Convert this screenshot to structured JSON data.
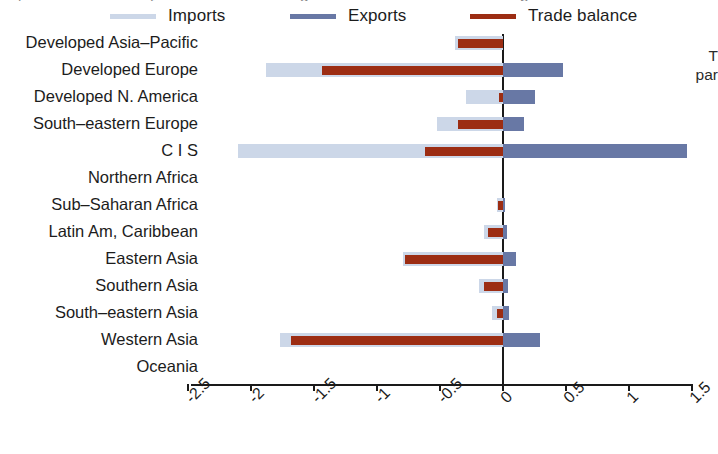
{
  "chart_data": {
    "type": "bar",
    "orientation": "horizontal",
    "title": "",
    "xlabel": "",
    "ylabel": "",
    "xlim": [
      -2.75,
      1.6
    ],
    "grid": false,
    "legend_position": "top",
    "categories": [
      "Developed Asia–Pacific",
      "Developed Europe",
      "Developed N. America",
      "South–eastern Europe",
      "C I S",
      "Northern Africa",
      "Sub–Saharan Africa",
      "Latin Am, Caribbean",
      "Eastern Asia",
      "Southern Asia",
      "South–eastern Asia",
      "Western Asia",
      "Oceania"
    ],
    "series": [
      {
        "name": "Imports",
        "color": "#ccd7e8",
        "values": [
          -0.38,
          -1.88,
          -0.29,
          -0.52,
          -2.1,
          0.0,
          -0.05,
          -0.15,
          -0.79,
          -0.19,
          -0.09,
          -1.77,
          0.0
        ]
      },
      {
        "name": "Exports",
        "color": "#6878a5",
        "values": [
          0.0,
          0.48,
          0.25,
          0.17,
          1.46,
          0.0,
          0.01,
          0.03,
          0.1,
          0.04,
          0.05,
          0.29,
          0.0
        ]
      },
      {
        "name": "Trade balance",
        "color": "#9c2d13",
        "values": [
          -0.36,
          -1.44,
          -0.03,
          -0.36,
          -0.62,
          0.0,
          -0.04,
          -0.12,
          -0.78,
          -0.15,
          -0.05,
          -1.68,
          0.0
        ]
      }
    ],
    "xticks": [
      -2.5,
      -2,
      -1.5,
      -1,
      -0.5,
      0,
      0.5,
      1,
      1.5
    ],
    "xtick_labels": [
      "-2.5",
      "-2",
      "-1.5",
      "-1",
      "-0.5",
      "0",
      "0.5",
      "1",
      "1.5"
    ]
  },
  "legend": {
    "items": [
      {
        "label": "Imports",
        "color": "#ccd7e8"
      },
      {
        "label": "Exports",
        "color": "#6878a5"
      },
      {
        "label": "Trade balance",
        "color": "#9c2d13"
      }
    ]
  },
  "right_caption": {
    "line1": "T",
    "line2": "par"
  },
  "top_sliver": {
    "a": "l",
    "b": "t",
    "c": "g",
    "d": "b"
  },
  "colors": {
    "imports": "#ccd7e8",
    "exports": "#6878a5",
    "balance": "#9c2d13",
    "axis": "#1a1a1a",
    "text": "#1c1c1c",
    "background": "#ffffff"
  }
}
